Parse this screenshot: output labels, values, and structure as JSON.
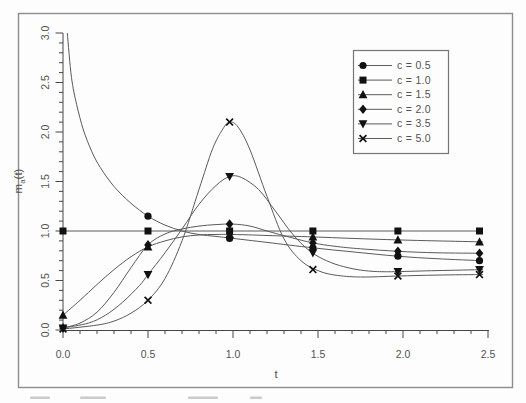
{
  "colors": {
    "background": "#fdfdfd",
    "border": "#8d8d8d",
    "axis": "#474747",
    "line": "#5a5a5a",
    "marker": "#111111",
    "text": "#525252",
    "legend_border": "#767676",
    "legend_bg": "#fdfdfd",
    "caption_smudge": "#9a9a9a"
  },
  "chart_data": {
    "type": "line",
    "title": "",
    "xlabel": "t",
    "ylabel": {
      "base": "m",
      "sub": "a",
      "suffix": "(t)"
    },
    "xlim": [
      0,
      2.5
    ],
    "ylim": [
      0,
      3.0
    ],
    "grid": false,
    "x_tick_values": [
      0,
      0.5,
      1.0,
      1.5,
      2.0,
      2.5
    ],
    "x_tick_labels": [
      "0.0",
      "0.5",
      "1.0",
      "1.5",
      "2.0",
      "2.5"
    ],
    "x_minor_step": 0.1,
    "y_tick_values": [
      0,
      0.5,
      1.0,
      1.5,
      2.0,
      2.5,
      3.0
    ],
    "y_tick_labels": [
      "0.0",
      "0.5",
      "1.0",
      "1.5",
      "2.0",
      "2.5",
      "3.0"
    ],
    "y_minor_step": 0.1,
    "legend": {
      "position": "top-right",
      "entries": [
        "c = 0.5",
        "c = 1.0",
        "c = 1.5",
        "c = 2.0",
        "c = 3.5",
        "c = 5.0"
      ]
    },
    "series": [
      {
        "name": "c = 0.5",
        "marker": "circle",
        "points": [
          [
            0.025,
            3.0
          ],
          [
            0.05,
            2.55
          ],
          [
            0.08,
            2.28
          ],
          [
            0.12,
            2.02
          ],
          [
            0.17,
            1.8
          ],
          [
            0.22,
            1.64
          ],
          [
            0.3,
            1.45
          ],
          [
            0.4,
            1.28
          ],
          [
            0.5,
            1.15
          ],
          [
            0.6,
            1.06
          ],
          [
            0.7,
            1.0
          ],
          [
            0.8,
            0.965
          ],
          [
            0.9,
            0.945
          ],
          [
            1.0,
            0.925
          ],
          [
            1.2,
            0.885
          ],
          [
            1.47,
            0.83
          ],
          [
            1.7,
            0.79
          ],
          [
            1.97,
            0.745
          ],
          [
            2.2,
            0.72
          ],
          [
            2.47,
            0.7
          ]
        ],
        "marker_points": [
          [
            0.5,
            1.15
          ],
          [
            0.98,
            0.925
          ],
          [
            1.47,
            0.83
          ],
          [
            1.97,
            0.745
          ],
          [
            2.45,
            0.7
          ]
        ]
      },
      {
        "name": "c = 1.0",
        "marker": "square",
        "points": [
          [
            0,
            1.0
          ],
          [
            2.47,
            1.0
          ]
        ],
        "marker_points": [
          [
            0,
            1.0
          ],
          [
            0.5,
            1.0
          ],
          [
            0.98,
            1.0
          ],
          [
            1.47,
            1.0
          ],
          [
            1.97,
            1.0
          ],
          [
            2.45,
            1.0
          ]
        ]
      },
      {
        "name": "c = 1.5",
        "marker": "triangle-up",
        "points": [
          [
            0,
            0.15
          ],
          [
            0.1,
            0.3
          ],
          [
            0.2,
            0.46
          ],
          [
            0.3,
            0.61
          ],
          [
            0.4,
            0.74
          ],
          [
            0.5,
            0.84
          ],
          [
            0.6,
            0.9
          ],
          [
            0.7,
            0.94
          ],
          [
            0.8,
            0.96
          ],
          [
            0.9,
            0.965
          ],
          [
            1.0,
            0.965
          ],
          [
            1.2,
            0.955
          ],
          [
            1.47,
            0.94
          ],
          [
            1.7,
            0.925
          ],
          [
            1.97,
            0.91
          ],
          [
            2.2,
            0.9
          ],
          [
            2.47,
            0.89
          ]
        ],
        "marker_points": [
          [
            0,
            0.15
          ],
          [
            0.5,
            0.84
          ],
          [
            0.98,
            0.965
          ],
          [
            1.47,
            0.94
          ],
          [
            1.97,
            0.91
          ],
          [
            2.45,
            0.89
          ]
        ]
      },
      {
        "name": "c = 2.0",
        "marker": "diamond",
        "points": [
          [
            0,
            0.02
          ],
          [
            0.1,
            0.07
          ],
          [
            0.2,
            0.18
          ],
          [
            0.3,
            0.38
          ],
          [
            0.4,
            0.63
          ],
          [
            0.5,
            0.86
          ],
          [
            0.6,
            0.97
          ],
          [
            0.7,
            1.02
          ],
          [
            0.8,
            1.05
          ],
          [
            0.9,
            1.065
          ],
          [
            1.0,
            1.07
          ],
          [
            1.1,
            1.05
          ],
          [
            1.2,
            1.0
          ],
          [
            1.35,
            0.93
          ],
          [
            1.47,
            0.88
          ],
          [
            1.6,
            0.845
          ],
          [
            1.75,
            0.82
          ],
          [
            1.97,
            0.795
          ],
          [
            2.2,
            0.78
          ],
          [
            2.47,
            0.775
          ]
        ],
        "marker_points": [
          [
            0,
            0.02
          ],
          [
            0.5,
            0.86
          ],
          [
            0.98,
            1.07
          ],
          [
            1.47,
            0.88
          ],
          [
            1.97,
            0.795
          ],
          [
            2.45,
            0.775
          ]
        ]
      },
      {
        "name": "c = 3.5",
        "marker": "triangle-down",
        "points": [
          [
            0,
            0.02
          ],
          [
            0.15,
            0.07
          ],
          [
            0.25,
            0.15
          ],
          [
            0.35,
            0.28
          ],
          [
            0.45,
            0.45
          ],
          [
            0.5,
            0.56
          ],
          [
            0.6,
            0.78
          ],
          [
            0.7,
            1.02
          ],
          [
            0.8,
            1.27
          ],
          [
            0.9,
            1.46
          ],
          [
            0.98,
            1.55
          ],
          [
            1.05,
            1.54
          ],
          [
            1.15,
            1.42
          ],
          [
            1.25,
            1.2
          ],
          [
            1.35,
            0.97
          ],
          [
            1.45,
            0.8
          ],
          [
            1.55,
            0.7
          ],
          [
            1.65,
            0.64
          ],
          [
            1.75,
            0.605
          ],
          [
            1.85,
            0.59
          ],
          [
            1.97,
            0.59
          ],
          [
            2.2,
            0.6
          ],
          [
            2.47,
            0.61
          ]
        ],
        "marker_points": [
          [
            0,
            0.02
          ],
          [
            0.5,
            0.56
          ],
          [
            0.98,
            1.55
          ],
          [
            1.47,
            0.78
          ],
          [
            1.97,
            0.59
          ],
          [
            2.45,
            0.61
          ]
        ]
      },
      {
        "name": "c = 5.0",
        "marker": "cross",
        "points": [
          [
            0,
            0.01
          ],
          [
            0.2,
            0.05
          ],
          [
            0.3,
            0.09
          ],
          [
            0.4,
            0.17
          ],
          [
            0.5,
            0.3
          ],
          [
            0.6,
            0.52
          ],
          [
            0.7,
            0.9
          ],
          [
            0.8,
            1.42
          ],
          [
            0.88,
            1.83
          ],
          [
            0.94,
            2.03
          ],
          [
            0.98,
            2.1
          ],
          [
            1.03,
            2.05
          ],
          [
            1.1,
            1.82
          ],
          [
            1.2,
            1.35
          ],
          [
            1.3,
            0.92
          ],
          [
            1.4,
            0.7
          ],
          [
            1.5,
            0.6
          ],
          [
            1.6,
            0.555
          ],
          [
            1.75,
            0.535
          ],
          [
            1.97,
            0.545
          ],
          [
            2.2,
            0.555
          ],
          [
            2.47,
            0.56
          ]
        ],
        "marker_points": [
          [
            0,
            0.01
          ],
          [
            0.5,
            0.3
          ],
          [
            0.98,
            2.1
          ],
          [
            1.47,
            0.61
          ],
          [
            1.97,
            0.545
          ],
          [
            2.45,
            0.56
          ]
        ]
      }
    ]
  },
  "caption_fragments": [
    {
      "x": 30,
      "w": 20
    },
    {
      "x": 80,
      "w": 26
    },
    {
      "x": 188,
      "w": 30
    },
    {
      "x": 250,
      "w": 12
    }
  ]
}
